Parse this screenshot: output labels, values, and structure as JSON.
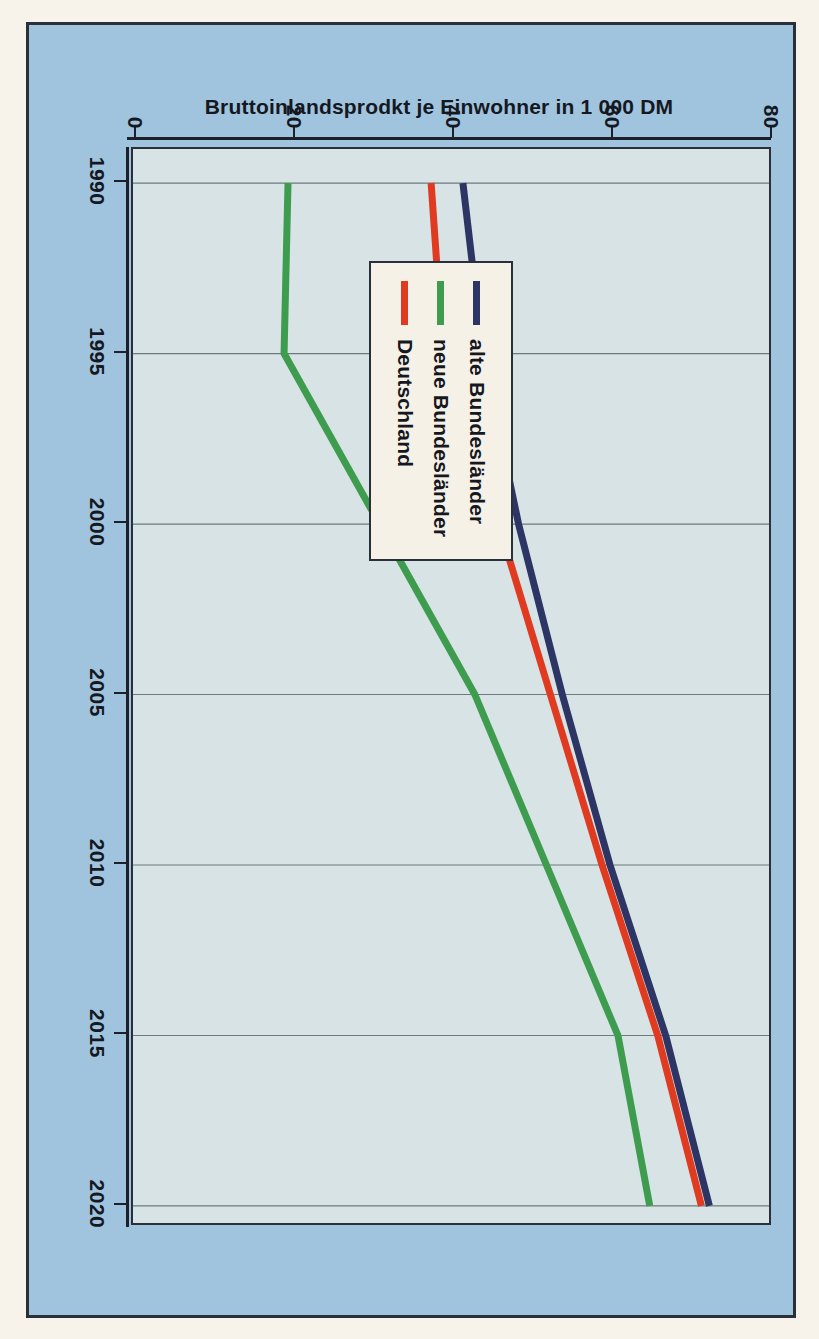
{
  "chart_data": {
    "type": "line",
    "title": "",
    "xlabel": "",
    "ylabel": "Bruttoinlandsprodkt je Einwohner in 1 000 DM",
    "x": [
      1990,
      1995,
      2000,
      2005,
      2010,
      2015,
      2020
    ],
    "xtick_labels": [
      "1990",
      "1995",
      "2000",
      "2005",
      "2010",
      "2015",
      "2020"
    ],
    "xlim": [
      1989,
      2020.5
    ],
    "ytick_labels": [
      "0",
      "20",
      "40",
      "60",
      "80"
    ],
    "ytick_values": [
      0,
      20,
      40,
      60,
      80
    ],
    "ylim": [
      0,
      80
    ],
    "grid": "horizontal-at-year-ticks",
    "legend_position": "inside-left-middle",
    "series": [
      {
        "name": "alte Bundesländer",
        "color": "#2c3564",
        "values": [
          41.5,
          44.0,
          48.5,
          54.0,
          60.0,
          67.0,
          72.5
        ]
      },
      {
        "name": "neue Bundesländer",
        "color": "#3d9c4e",
        "values": [
          19.5,
          19.0,
          31.0,
          43.0,
          52.0,
          61.0,
          65.0
        ]
      },
      {
        "name": "Deutschland",
        "color": "#e03b20",
        "values": [
          37.5,
          39.0,
          46.0,
          52.5,
          59.0,
          66.0,
          71.5
        ]
      }
    ]
  },
  "legend": {
    "items": [
      {
        "label": "alte Bundesländer",
        "color": "#2c3564"
      },
      {
        "label": "neue Bundesländer",
        "color": "#3d9c4e"
      },
      {
        "label": "Deutschland",
        "color": "#e03b20"
      }
    ]
  },
  "axes": {
    "y_title": "Bruttoinlandsprodkt je Einwohner in 1 000 DM",
    "y_ticks": [
      "80",
      "60",
      "40",
      "20",
      "0"
    ],
    "x_ticks": [
      "1990",
      "1995",
      "2000",
      "2005",
      "2010",
      "2015",
      "2020"
    ]
  },
  "colors": {
    "page_background": "#f7f3ea",
    "poster_background": "#a0c4de",
    "plot_background": "#d7e3e5",
    "frame": "#2b2f3a",
    "grid": "#6d7a80",
    "alte_bundeslaender": "#2c3564",
    "neue_bundeslaender": "#3d9c4e",
    "deutschland": "#e03b20"
  }
}
